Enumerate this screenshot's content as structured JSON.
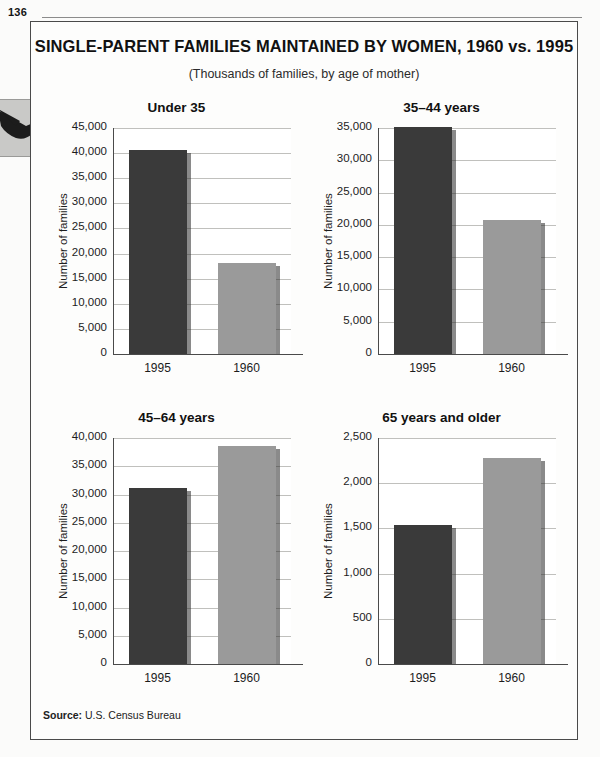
{
  "page": {
    "number": "136"
  },
  "figure": {
    "title": "SINGLE-PARENT FAMILIES MAINTAINED BY WOMEN, 1960 vs. 1995",
    "subtitle": "(Thousands of families, by age of mother)",
    "source_label": "Source:",
    "source_text": "U.S. Census Bureau"
  },
  "colors": {
    "bar_1995": "#3a3a3a",
    "bar_1960": "#9a9a9a",
    "frame": "#4a4a4a",
    "gridline": "#c0c0bd",
    "page_bg": "#fdfdfc"
  },
  "chart_data": [
    {
      "type": "bar",
      "title": "Under 35",
      "xlabel": "",
      "ylabel": "Number of families",
      "categories": [
        "1995",
        "1960"
      ],
      "values": [
        40700,
        18100
      ],
      "ylim": [
        0,
        45000
      ],
      "yticks": [
        0,
        5000,
        10000,
        15000,
        20000,
        25000,
        30000,
        35000,
        40000,
        45000
      ],
      "ytick_labels": [
        "0",
        "5,000",
        "10,000",
        "15,000",
        "20,000",
        "25,000",
        "30,000",
        "35,000",
        "40,000",
        "45,000"
      ],
      "grid": true,
      "legend": "none",
      "bar_colors": [
        "#3a3a3a",
        "#9a9a9a"
      ]
    },
    {
      "type": "bar",
      "title": "35–44 years",
      "xlabel": "",
      "ylabel": "Number of families",
      "categories": [
        "1995",
        "1960"
      ],
      "values": [
        35200,
        20700
      ],
      "ylim": [
        0,
        35000
      ],
      "yticks": [
        0,
        5000,
        10000,
        15000,
        20000,
        25000,
        30000,
        35000
      ],
      "ytick_labels": [
        "0",
        "5,000",
        "10,000",
        "15,000",
        "20,000",
        "25,000",
        "30,000",
        "35,000"
      ],
      "grid": true,
      "legend": "none",
      "bar_colors": [
        "#3a3a3a",
        "#9a9a9a"
      ]
    },
    {
      "type": "bar",
      "title": "45–64 years",
      "xlabel": "",
      "ylabel": "Number of families",
      "categories": [
        "1995",
        "1960"
      ],
      "values": [
        31100,
        38600
      ],
      "ylim": [
        0,
        40000
      ],
      "yticks": [
        0,
        5000,
        10000,
        15000,
        20000,
        25000,
        30000,
        35000,
        40000
      ],
      "ytick_labels": [
        "0",
        "5,000",
        "10,000",
        "15,000",
        "20,000",
        "25,000",
        "30,000",
        "35,000",
        "40,000"
      ],
      "grid": true,
      "legend": "none",
      "bar_colors": [
        "#3a3a3a",
        "#9a9a9a"
      ]
    },
    {
      "type": "bar",
      "title": "65 years and older",
      "xlabel": "",
      "ylabel": "Number of families",
      "categories": [
        "1995",
        "1960"
      ],
      "values": [
        1540,
        2280
      ],
      "ylim": [
        0,
        2500
      ],
      "yticks": [
        0,
        500,
        1000,
        1500,
        2000,
        2500
      ],
      "ytick_labels": [
        "0",
        "500",
        "1,000",
        "1,500",
        "2,000",
        "2,500"
      ],
      "grid": true,
      "legend": "none",
      "bar_colors": [
        "#3a3a3a",
        "#9a9a9a"
      ]
    }
  ]
}
